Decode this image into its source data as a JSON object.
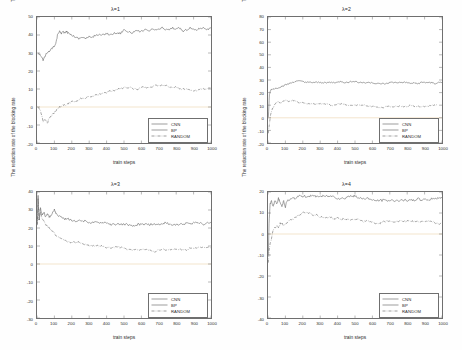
{
  "figure": {
    "background_color": "#fefefe",
    "axis_color": "#6f6f6f",
    "text_color": "#2b2b2b",
    "zero_line_color": "#e6c89a"
  },
  "common": {
    "ylabel": "The reduction rate of the blocking rate",
    "xlabel": "train steps",
    "xticks": [
      "0",
      "100",
      "200",
      "300",
      "400",
      "500",
      "600",
      "700",
      "800",
      "900",
      "1000"
    ],
    "legend": [
      {
        "label": "CNN",
        "style": "solid"
      },
      {
        "label": "BP",
        "style": "solid"
      },
      {
        "label": "RANDOM",
        "style": "dashdot"
      }
    ]
  },
  "chart_data": [
    {
      "id": "lambda-1",
      "type": "line",
      "title": "λ=1",
      "xlabel": "train steps",
      "ylabel": "The reduction rate of the blocking rate",
      "xlim": [
        0,
        1000
      ],
      "ylim": [
        -20,
        50
      ],
      "yticks": [
        50,
        40,
        30,
        20,
        10,
        0,
        -10,
        -20
      ],
      "xticks": [
        0,
        100,
        200,
        300,
        400,
        500,
        600,
        700,
        800,
        900,
        1000
      ],
      "grid": false,
      "legend_position": "lower-right",
      "series": [
        {
          "name": "CNN",
          "style": "solid",
          "x": [
            5,
            20,
            35,
            50,
            60,
            70,
            80,
            90,
            100,
            110,
            120,
            130,
            140,
            150,
            160,
            170,
            180,
            200,
            220,
            240,
            260,
            280,
            300,
            320,
            340,
            360,
            380,
            400,
            420,
            440,
            460,
            480,
            500,
            520,
            540,
            560,
            580,
            600,
            620,
            640,
            660,
            680,
            700,
            720,
            740,
            760,
            780,
            800,
            820,
            840,
            860,
            880,
            900,
            920,
            940,
            960,
            980,
            1000
          ],
          "values": [
            30,
            29,
            26,
            29,
            30,
            31,
            32,
            33,
            34,
            36,
            41,
            42,
            41,
            42,
            41,
            42,
            41,
            40,
            39,
            38,
            39,
            38,
            39,
            39,
            40,
            40,
            40,
            41,
            40,
            41,
            41,
            41,
            43,
            42,
            41,
            42,
            42,
            42,
            43,
            42,
            43,
            43,
            43,
            44,
            43,
            43,
            44,
            43,
            44,
            42,
            43,
            44,
            43,
            43,
            44,
            44,
            43,
            44
          ]
        },
        {
          "name": "RANDOM",
          "style": "dashdot",
          "x": [
            5,
            20,
            35,
            50,
            60,
            70,
            80,
            90,
            100,
            110,
            120,
            130,
            140,
            150,
            160,
            180,
            200,
            220,
            240,
            260,
            280,
            300,
            320,
            340,
            360,
            380,
            400,
            420,
            440,
            460,
            480,
            500,
            520,
            540,
            560,
            580,
            600,
            620,
            640,
            660,
            680,
            700,
            720,
            740,
            760,
            780,
            800,
            820,
            840,
            860,
            880,
            900,
            920,
            940,
            960,
            980,
            1000
          ],
          "values": [
            0,
            -2,
            -8,
            -7,
            -9,
            -6,
            -5,
            -4,
            -3,
            -2,
            -1,
            0,
            0,
            1,
            1,
            2,
            3,
            3,
            4,
            5,
            5,
            6,
            6,
            7,
            7,
            8,
            8,
            9,
            9,
            10,
            10,
            11,
            11,
            11,
            10,
            10,
            11,
            11,
            11,
            11,
            12,
            12,
            12,
            12,
            11,
            11,
            11,
            10,
            10,
            10,
            9,
            9,
            9,
            10,
            10,
            10,
            11
          ]
        }
      ]
    },
    {
      "id": "lambda-2",
      "type": "line",
      "title": "λ=2",
      "xlabel": "train steps",
      "ylabel": "The reduction rate of the blocking rate",
      "xlim": [
        0,
        1000
      ],
      "ylim": [
        -20,
        80
      ],
      "yticks": [
        80,
        70,
        60,
        50,
        40,
        30,
        20,
        10,
        0,
        -10,
        -20
      ],
      "xticks": [
        0,
        100,
        200,
        300,
        400,
        500,
        600,
        700,
        800,
        900,
        1000
      ],
      "grid": false,
      "legend_position": "lower-right",
      "series": [
        {
          "name": "CNN",
          "style": "solid",
          "x": [
            2,
            8,
            15,
            25,
            40,
            60,
            80,
            100,
            120,
            140,
            160,
            180,
            200,
            220,
            240,
            260,
            280,
            300,
            320,
            340,
            360,
            380,
            400,
            420,
            440,
            460,
            480,
            500,
            520,
            540,
            560,
            580,
            600,
            620,
            640,
            660,
            680,
            700,
            720,
            740,
            760,
            780,
            800,
            820,
            840,
            860,
            880,
            900,
            920,
            940,
            960,
            980,
            1000
          ],
          "values": [
            0,
            18,
            22,
            23,
            23,
            24,
            25,
            26,
            27,
            28,
            29,
            29,
            29,
            28,
            28,
            28,
            28,
            28,
            28,
            28,
            28,
            28,
            28,
            29,
            28,
            28,
            29,
            29,
            28,
            28,
            28,
            28,
            28,
            27,
            27,
            27,
            27,
            28,
            28,
            28,
            28,
            28,
            28,
            27,
            28,
            27,
            28,
            28,
            28,
            28,
            27,
            28,
            28
          ]
        },
        {
          "name": "RANDOM",
          "style": "dashdot",
          "x": [
            2,
            8,
            15,
            25,
            40,
            55,
            70,
            85,
            100,
            120,
            140,
            160,
            180,
            200,
            220,
            240,
            260,
            280,
            300,
            320,
            340,
            360,
            380,
            400,
            420,
            440,
            460,
            480,
            500,
            520,
            540,
            560,
            580,
            600,
            620,
            640,
            660,
            680,
            700,
            720,
            740,
            760,
            780,
            800,
            820,
            840,
            860,
            880,
            900,
            920,
            940,
            960,
            980,
            1000
          ],
          "values": [
            -12,
            -5,
            3,
            7,
            11,
            13,
            12,
            13,
            14,
            13,
            14,
            13,
            12,
            12,
            11,
            11,
            11,
            11,
            11,
            11,
            11,
            10,
            10,
            11,
            11,
            11,
            10,
            10,
            10,
            10,
            10,
            10,
            9,
            9,
            9,
            8,
            8,
            9,
            9,
            9,
            9,
            9,
            9,
            9,
            10,
            9,
            9,
            9,
            9,
            9,
            10,
            10,
            11
          ]
        }
      ]
    },
    {
      "id": "lambda-3",
      "type": "line",
      "title": "λ=3",
      "xlabel": "train steps",
      "ylabel": "The reduction rate of the blocking rate",
      "xlim": [
        0,
        1000
      ],
      "ylim": [
        -30,
        40
      ],
      "yticks": [
        40,
        30,
        20,
        10,
        0,
        -10,
        -20,
        -30
      ],
      "xticks": [
        0,
        100,
        200,
        300,
        400,
        500,
        600,
        700,
        800,
        900,
        1000
      ],
      "grid": false,
      "legend_position": "lower-right",
      "series": [
        {
          "name": "CNN",
          "style": "solid",
          "x": [
            2,
            6,
            12,
            20,
            30,
            40,
            50,
            60,
            70,
            80,
            90,
            100,
            110,
            120,
            140,
            160,
            180,
            200,
            220,
            240,
            260,
            280,
            300,
            320,
            340,
            360,
            380,
            400,
            420,
            440,
            460,
            480,
            500,
            520,
            540,
            560,
            580,
            600,
            620,
            640,
            660,
            680,
            700,
            720,
            740,
            760,
            780,
            800,
            820,
            840,
            860,
            880,
            900,
            920,
            940,
            960,
            980,
            1000
          ],
          "values": [
            22,
            38,
            25,
            31,
            27,
            29,
            26,
            28,
            26,
            27,
            29,
            30,
            28,
            27,
            26,
            25,
            25,
            24,
            24,
            24,
            24,
            24,
            23,
            23,
            23,
            23,
            23,
            23,
            22,
            22,
            22,
            22,
            22,
            22,
            21,
            21,
            22,
            22,
            22,
            22,
            22,
            22,
            22,
            22,
            23,
            22,
            22,
            22,
            22,
            22,
            23,
            22,
            23,
            23,
            23,
            22,
            23,
            23
          ]
        },
        {
          "name": "RANDOM",
          "style": "dashdot",
          "x": [
            2,
            6,
            12,
            20,
            30,
            40,
            50,
            60,
            70,
            80,
            90,
            100,
            120,
            140,
            160,
            180,
            200,
            220,
            240,
            260,
            280,
            300,
            320,
            340,
            360,
            380,
            400,
            420,
            440,
            460,
            480,
            500,
            520,
            540,
            560,
            580,
            600,
            620,
            640,
            660,
            680,
            700,
            720,
            740,
            760,
            780,
            800,
            820,
            840,
            860,
            880,
            900,
            920,
            940,
            960,
            980,
            1000
          ],
          "values": [
            22,
            36,
            24,
            29,
            25,
            24,
            22,
            21,
            20,
            19,
            18,
            17,
            15,
            14,
            13,
            12,
            12,
            12,
            12,
            11,
            11,
            10,
            10,
            10,
            10,
            10,
            9,
            9,
            9,
            10,
            9,
            9,
            8,
            8,
            8,
            8,
            8,
            8,
            8,
            7,
            7,
            8,
            8,
            8,
            8,
            8,
            8,
            8,
            8,
            8,
            9,
            9,
            9,
            9,
            9,
            9,
            9
          ]
        }
      ]
    },
    {
      "id": "lambda-4",
      "type": "line",
      "title": "λ=4",
      "xlabel": "train steps",
      "ylabel": "The reduction rate of the blocking rate",
      "xlim": [
        0,
        1000
      ],
      "ylim": [
        -40,
        20
      ],
      "yticks": [
        20,
        10,
        0,
        -10,
        -20,
        -30,
        -40
      ],
      "xticks": [
        0,
        100,
        200,
        300,
        400,
        500,
        600,
        700,
        800,
        900,
        1000
      ],
      "grid": false,
      "legend_position": "lower-right",
      "series": [
        {
          "name": "CNN",
          "style": "solid",
          "x": [
            2,
            6,
            12,
            20,
            30,
            40,
            50,
            60,
            70,
            80,
            90,
            100,
            110,
            120,
            140,
            160,
            180,
            200,
            220,
            240,
            260,
            280,
            300,
            320,
            340,
            360,
            380,
            400,
            420,
            440,
            460,
            480,
            500,
            520,
            540,
            560,
            580,
            600,
            620,
            640,
            660,
            680,
            700,
            720,
            740,
            760,
            780,
            800,
            820,
            840,
            860,
            880,
            900,
            920,
            940,
            960,
            980,
            1000
          ],
          "values": [
            -10,
            5,
            14,
            16,
            13,
            16,
            14,
            17,
            15,
            13,
            16,
            13,
            16,
            16,
            17,
            17,
            18,
            18,
            18,
            18,
            18,
            18,
            18,
            18,
            18,
            18,
            18,
            17,
            17,
            17,
            18,
            18,
            18,
            17,
            17,
            17,
            17,
            16,
            16,
            16,
            16,
            16,
            16,
            16,
            16,
            16,
            16,
            16,
            16,
            16,
            17,
            16,
            17,
            16,
            17,
            17,
            17,
            17
          ]
        },
        {
          "name": "RANDOM",
          "style": "dashdot",
          "x": [
            2,
            6,
            12,
            20,
            30,
            40,
            50,
            60,
            70,
            80,
            90,
            100,
            120,
            140,
            160,
            180,
            200,
            220,
            240,
            260,
            280,
            300,
            320,
            340,
            360,
            380,
            400,
            420,
            440,
            460,
            480,
            500,
            520,
            540,
            560,
            580,
            600,
            620,
            640,
            660,
            680,
            700,
            720,
            740,
            760,
            780,
            800,
            820,
            840,
            860,
            880,
            900,
            920,
            940,
            960,
            980,
            1000
          ],
          "values": [
            -14,
            -8,
            -5,
            -2,
            2,
            3,
            4,
            3,
            5,
            5,
            4,
            5,
            6,
            7,
            8,
            9,
            10,
            10,
            10,
            9,
            9,
            8,
            8,
            8,
            8,
            7,
            8,
            7,
            7,
            7,
            7,
            7,
            7,
            6,
            6,
            6,
            6,
            5,
            5,
            6,
            6,
            6,
            6,
            6,
            6,
            6,
            6,
            6,
            6,
            6,
            6,
            6,
            6,
            6,
            5,
            5,
            5
          ]
        }
      ]
    }
  ]
}
